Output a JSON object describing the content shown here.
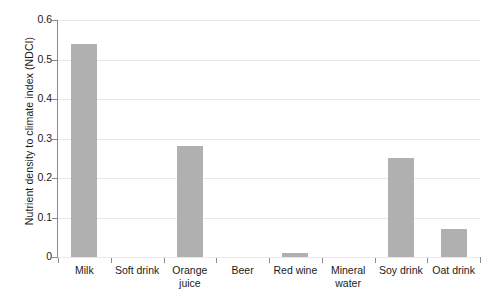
{
  "chart_data": {
    "type": "bar",
    "title": "",
    "xlabel": "",
    "ylabel": "Nutrient density to climate index (NDCI)",
    "categories": [
      "Milk",
      "Soft drink",
      "Orange juice",
      "Beer",
      "Red wine",
      "Mineral water",
      "Soy drink",
      "Oat drink"
    ],
    "category_lines": [
      [
        "Milk"
      ],
      [
        "Soft drink"
      ],
      [
        "Orange",
        "juice"
      ],
      [
        "Beer"
      ],
      [
        "Red wine"
      ],
      [
        "Mineral",
        "water"
      ],
      [
        "Soy drink"
      ],
      [
        "Oat drink"
      ]
    ],
    "values": [
      0.54,
      0,
      0.28,
      0,
      0.01,
      0,
      0.25,
      0.07
    ],
    "ylim": [
      0,
      0.6
    ],
    "yticks": [
      0,
      0.1,
      0.2,
      0.3,
      0.4,
      0.5,
      0.6
    ],
    "ytick_labels": [
      "0",
      "0.1",
      "0.2",
      "0.3",
      "0.4",
      "0.5",
      "0.6"
    ],
    "grid": true,
    "legend": null,
    "bar_color": "#b0b0b0",
    "grid_color": "#e9e9e9",
    "axis_color": "#8a8a8a"
  }
}
